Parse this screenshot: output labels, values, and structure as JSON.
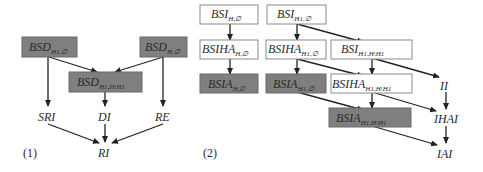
{
  "colors": {
    "dark_box": "#7f7f7f",
    "light_box": "#ffffff",
    "border": "#8a8a8a",
    "edge": "#222222",
    "text": "#2a2a2a"
  },
  "panels": [
    {
      "label": "(1)",
      "nodes": [
        {
          "id": "bsd_h1_empty",
          "base": "BSD",
          "sub": "H1,∅",
          "style": "dark"
        },
        {
          "id": "bsd_h_empty",
          "base": "BSD",
          "sub": "H,∅",
          "style": "dark"
        },
        {
          "id": "bsd_h1_hmh1",
          "base": "BSD",
          "sub": "H1,H\\H1",
          "style": "dark"
        },
        {
          "id": "sri",
          "base": "SRI",
          "sub": "",
          "style": "plain"
        },
        {
          "id": "di",
          "base": "DI",
          "sub": "",
          "style": "plain"
        },
        {
          "id": "re",
          "base": "RE",
          "sub": "",
          "style": "plain"
        },
        {
          "id": "ri",
          "base": "RI",
          "sub": "",
          "style": "plain"
        }
      ],
      "edges": [
        [
          "bsd_h1_empty",
          "bsd_h1_hmh1"
        ],
        [
          "bsd_h_empty",
          "bsd_h1_hmh1"
        ],
        [
          "bsd_h1_empty",
          "sri"
        ],
        [
          "bsd_h1_hmh1",
          "di"
        ],
        [
          "bsd_h_empty",
          "re"
        ],
        [
          "sri",
          "ri"
        ],
        [
          "di",
          "ri"
        ],
        [
          "re",
          "ri"
        ]
      ]
    },
    {
      "label": "(2)",
      "nodes": [
        {
          "id": "bsi_h_empty",
          "base": "BSI",
          "sub": "H,∅",
          "style": "light"
        },
        {
          "id": "bsi_h1_empty",
          "base": "BSI",
          "sub": "H1,∅",
          "style": "light"
        },
        {
          "id": "bsiha_h_empty",
          "base": "BSIHA",
          "sub": "H,∅",
          "style": "light"
        },
        {
          "id": "bsiha_h1_empty",
          "base": "BSIHA",
          "sub": "H1,∅",
          "style": "light"
        },
        {
          "id": "bsi_h1_hmh1",
          "base": "BSI",
          "sub": "H1,H\\H1",
          "style": "light"
        },
        {
          "id": "bsia_h_empty",
          "base": "BSIA",
          "sub": "H,∅",
          "style": "dark"
        },
        {
          "id": "bsia_h1_empty",
          "base": "BSIA",
          "sub": "H1,∅",
          "style": "dark"
        },
        {
          "id": "bsiha_h1_hmh1",
          "base": "BSIHA",
          "sub": "H1,H\\H1",
          "style": "light"
        },
        {
          "id": "bsia_h1_hmh1",
          "base": "BSIA",
          "sub": "H1,H\\H1",
          "style": "dark"
        },
        {
          "id": "ii",
          "base": "II",
          "sub": "",
          "style": "plain"
        },
        {
          "id": "ihai",
          "base": "IHAI",
          "sub": "",
          "style": "plain"
        },
        {
          "id": "iai",
          "base": "IAI",
          "sub": "",
          "style": "plain"
        }
      ],
      "edges": [
        [
          "bsi_h_empty",
          "bsiha_h_empty"
        ],
        [
          "bsiha_h_empty",
          "bsia_h_empty"
        ],
        [
          "bsi_h1_empty",
          "bsiha_h1_empty"
        ],
        [
          "bsi_h1_empty",
          "bsi_h1_hmh1"
        ],
        [
          "bsiha_h1_empty",
          "bsia_h1_empty"
        ],
        [
          "bsiha_h1_empty",
          "bsiha_h1_hmh1"
        ],
        [
          "bsi_h1_hmh1",
          "bsiha_h1_hmh1"
        ],
        [
          "bsi_h1_hmh1",
          "ii"
        ],
        [
          "bsia_h1_empty",
          "bsia_h1_hmh1"
        ],
        [
          "bsiha_h1_hmh1",
          "bsia_h1_hmh1"
        ],
        [
          "bsiha_h1_hmh1",
          "ihai"
        ],
        [
          "bsia_h1_hmh1",
          "iai"
        ],
        [
          "ii",
          "ihai"
        ],
        [
          "ihai",
          "iai"
        ]
      ]
    }
  ]
}
